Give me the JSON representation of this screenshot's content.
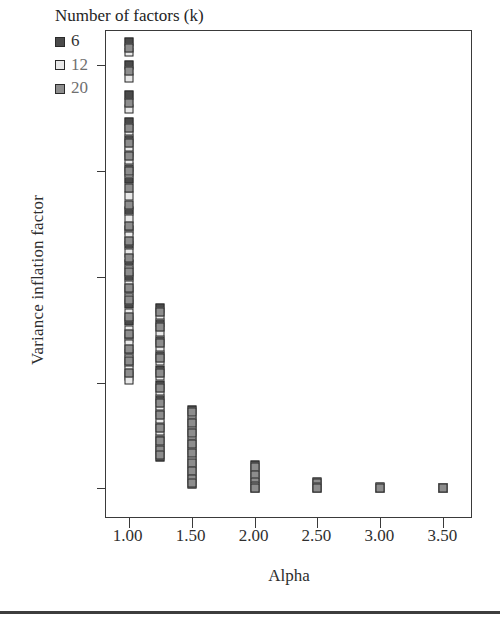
{
  "chart_data": {
    "type": "scatter",
    "title": "",
    "xlabel": "Alpha",
    "ylabel": "Variance inflation factor",
    "xlim": [
      0.82,
      3.72
    ],
    "ylim": [
      -0.35,
      22.6
    ],
    "xticks": [
      "1.00",
      "1.50",
      "2.00",
      "2.50",
      "3.00",
      "3.50"
    ],
    "xtick_values": [
      1.0,
      1.5,
      2.0,
      2.5,
      3.0,
      3.5
    ],
    "yticks": [
      "21",
      "16",
      "11",
      "6",
      "1"
    ],
    "ytick_values": [
      21,
      16,
      11,
      6,
      1
    ],
    "grid": false,
    "legend_position": "top-left",
    "legend_title": "Number of factors (k)",
    "series": [
      {
        "name": "6",
        "key": "k6",
        "color": "#4a4a4a",
        "points": [
          [
            1.0,
            22.1
          ],
          [
            1.0,
            21.0
          ],
          [
            1.0,
            19.6
          ],
          [
            1.0,
            18.3
          ],
          [
            1.0,
            17.5
          ],
          [
            1.0,
            16.9
          ],
          [
            1.0,
            16.2
          ],
          [
            1.0,
            15.6
          ],
          [
            1.0,
            14.1
          ],
          [
            1.0,
            13.2
          ],
          [
            1.0,
            12.5
          ],
          [
            1.0,
            11.6
          ],
          [
            1.0,
            11.0
          ],
          [
            1.0,
            10.3
          ],
          [
            1.0,
            9.7
          ],
          [
            1.0,
            8.9
          ],
          [
            1.0,
            8.1
          ],
          [
            1.0,
            7.4
          ],
          [
            1.0,
            6.9
          ],
          [
            1.0,
            6.3
          ],
          [
            1.25,
            9.5
          ],
          [
            1.25,
            8.8
          ],
          [
            1.25,
            8.0
          ],
          [
            1.25,
            7.3
          ],
          [
            1.25,
            6.6
          ],
          [
            1.25,
            5.9
          ],
          [
            1.25,
            5.2
          ],
          [
            1.25,
            4.6
          ],
          [
            1.25,
            4.0
          ],
          [
            1.25,
            3.4
          ],
          [
            1.25,
            2.9
          ],
          [
            1.25,
            2.5
          ],
          [
            1.5,
            4.7
          ],
          [
            1.5,
            4.2
          ],
          [
            1.5,
            3.7
          ],
          [
            1.5,
            3.2
          ],
          [
            1.5,
            2.8
          ],
          [
            1.5,
            2.3
          ],
          [
            1.5,
            1.9
          ],
          [
            1.5,
            1.5
          ],
          [
            1.5,
            1.2
          ],
          [
            2.0,
            2.1
          ],
          [
            2.0,
            1.7
          ],
          [
            2.0,
            1.4
          ],
          [
            2.0,
            1.1
          ],
          [
            2.0,
            1.0
          ],
          [
            2.5,
            1.3
          ],
          [
            2.5,
            1.1
          ],
          [
            2.5,
            1.0
          ],
          [
            3.0,
            1.05
          ],
          [
            3.0,
            1.0
          ],
          [
            3.5,
            1.02
          ],
          [
            3.5,
            1.0
          ]
        ]
      },
      {
        "name": "12",
        "key": "k12",
        "color": "#e8e8e8",
        "points": [
          [
            1.0,
            21.6
          ],
          [
            1.0,
            20.4
          ],
          [
            1.0,
            18.9
          ],
          [
            1.0,
            17.9
          ],
          [
            1.0,
            17.1
          ],
          [
            1.0,
            16.5
          ],
          [
            1.0,
            15.9
          ],
          [
            1.0,
            14.8
          ],
          [
            1.0,
            13.7
          ],
          [
            1.0,
            12.9
          ],
          [
            1.0,
            12.1
          ],
          [
            1.0,
            11.3
          ],
          [
            1.0,
            10.6
          ],
          [
            1.0,
            10.0
          ],
          [
            1.0,
            9.3
          ],
          [
            1.0,
            8.5
          ],
          [
            1.0,
            7.8
          ],
          [
            1.0,
            7.1
          ],
          [
            1.0,
            6.6
          ],
          [
            1.0,
            6.1
          ],
          [
            1.25,
            9.2
          ],
          [
            1.25,
            8.4
          ],
          [
            1.25,
            7.7
          ],
          [
            1.25,
            7.0
          ],
          [
            1.25,
            6.3
          ],
          [
            1.25,
            5.6
          ],
          [
            1.25,
            4.9
          ],
          [
            1.25,
            4.3
          ],
          [
            1.25,
            3.7
          ],
          [
            1.25,
            3.1
          ],
          [
            1.25,
            2.7
          ],
          [
            1.5,
            4.5
          ],
          [
            1.5,
            4.0
          ],
          [
            1.5,
            3.5
          ],
          [
            1.5,
            3.0
          ],
          [
            1.5,
            2.5
          ],
          [
            1.5,
            2.1
          ],
          [
            1.5,
            1.7
          ],
          [
            1.5,
            1.35
          ],
          [
            2.0,
            1.95
          ],
          [
            2.0,
            1.55
          ],
          [
            2.0,
            1.25
          ],
          [
            2.0,
            1.05
          ],
          [
            2.5,
            1.2
          ],
          [
            2.5,
            1.05
          ],
          [
            3.0,
            1.0
          ],
          [
            3.5,
            1.0
          ]
        ]
      },
      {
        "name": "20",
        "key": "k20",
        "color": "#8d8d8d",
        "points": [
          [
            1.0,
            21.8
          ],
          [
            1.0,
            20.7
          ],
          [
            1.0,
            19.2
          ],
          [
            1.0,
            18.0
          ],
          [
            1.0,
            17.3
          ],
          [
            1.0,
            16.7
          ],
          [
            1.0,
            16.0
          ],
          [
            1.0,
            15.2
          ],
          [
            1.0,
            14.4
          ],
          [
            1.0,
            13.4
          ],
          [
            1.0,
            12.7
          ],
          [
            1.0,
            11.9
          ],
          [
            1.0,
            11.2
          ],
          [
            1.0,
            10.45
          ],
          [
            1.0,
            9.9
          ],
          [
            1.0,
            9.1
          ],
          [
            1.0,
            8.3
          ],
          [
            1.0,
            7.6
          ],
          [
            1.0,
            7.0
          ],
          [
            1.0,
            6.45
          ],
          [
            1.25,
            9.35
          ],
          [
            1.25,
            8.6
          ],
          [
            1.25,
            7.85
          ],
          [
            1.25,
            7.15
          ],
          [
            1.25,
            6.45
          ],
          [
            1.25,
            5.75
          ],
          [
            1.25,
            5.05
          ],
          [
            1.25,
            4.45
          ],
          [
            1.25,
            3.85
          ],
          [
            1.25,
            3.25
          ],
          [
            1.25,
            2.8
          ],
          [
            1.25,
            2.6
          ],
          [
            1.5,
            4.6
          ],
          [
            1.5,
            4.1
          ],
          [
            1.5,
            3.6
          ],
          [
            1.5,
            3.1
          ],
          [
            1.5,
            2.65
          ],
          [
            1.5,
            2.2
          ],
          [
            1.5,
            1.8
          ],
          [
            1.5,
            1.45
          ],
          [
            1.5,
            1.25
          ],
          [
            2.0,
            2.0
          ],
          [
            2.0,
            1.65
          ],
          [
            2.0,
            1.3
          ],
          [
            2.0,
            1.1
          ],
          [
            2.0,
            1.0
          ],
          [
            2.5,
            1.25
          ],
          [
            2.5,
            1.08
          ],
          [
            2.5,
            1.0
          ],
          [
            3.0,
            1.02
          ],
          [
            3.5,
            1.0
          ]
        ]
      }
    ]
  },
  "legend": {
    "title": "Number of factors (k)",
    "entries": [
      {
        "label": "6",
        "swatch": "#4a4a4a"
      },
      {
        "label": "12",
        "swatch": "#e8e8e8"
      },
      {
        "label": "20",
        "swatch": "#8d8d8d"
      }
    ]
  },
  "axes": {
    "x_title": "Alpha",
    "y_title": "Variance inflation factor"
  }
}
